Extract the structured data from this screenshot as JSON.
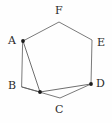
{
  "figure": {
    "kind": "geometry-diagram",
    "background_color": "#fefefe",
    "line_color": "#6b6b6b",
    "dot_color": "#1c1c1c",
    "label_color": "#2b2b2b"
  },
  "labels": {
    "a": "A",
    "b": "B",
    "c": "C",
    "d": "D",
    "e": "E",
    "f": "F"
  },
  "chart_data": {
    "type": "diagram",
    "title": "",
    "points": [
      {
        "name": "A",
        "x": 23,
        "y": 41,
        "has_dot": true,
        "label_x": 8,
        "label_y": 35
      },
      {
        "name": "B",
        "x": 22,
        "y": 87,
        "has_dot": false,
        "label_x": 8,
        "label_y": 80
      },
      {
        "name": "C",
        "x": 60,
        "y": 98,
        "has_dot": false,
        "label_x": 55,
        "label_y": 104
      },
      {
        "name": "D",
        "x": 91,
        "y": 84,
        "has_dot": true,
        "label_x": 96,
        "label_y": 78
      },
      {
        "name": "E",
        "x": 92,
        "y": 40,
        "has_dot": false,
        "label_x": 97,
        "label_y": 37
      },
      {
        "name": "F",
        "x": 59,
        "y": 22,
        "has_dot": false,
        "label_x": 55,
        "label_y": 5
      },
      {
        "name": "P",
        "x": 40,
        "y": 92,
        "has_dot": true,
        "label_x": null,
        "label_y": null
      }
    ],
    "polygon": [
      "A",
      "F",
      "E",
      "D",
      "C",
      "B"
    ],
    "chords": [
      [
        "A",
        "P"
      ],
      [
        "B",
        "P"
      ],
      [
        "P",
        "D"
      ]
    ],
    "xlim": [
      0,
      112
    ],
    "ylim": [
      0,
      123
    ]
  }
}
